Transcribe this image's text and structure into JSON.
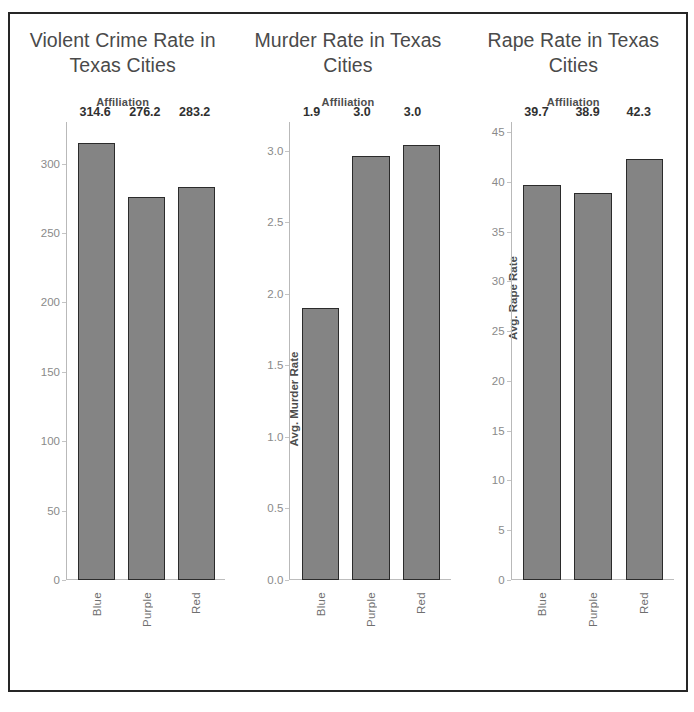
{
  "page": {
    "border_color": "#262626",
    "background": "#ffffff"
  },
  "style": {
    "bar_fill": "#848484",
    "bar_stroke": "#2b2b2b",
    "axis_color": "#b9b9b9",
    "tick_text_color": "#8a8a8a",
    "title_color": "#4a4a4a",
    "value_label_color": "#303030"
  },
  "charts": [
    {
      "title": "Violent Crime Rate in Texas Cities",
      "legend_title": "Affiliation",
      "ylabel": "Avg. Violent Crime Rate",
      "categories": [
        "Blue",
        "Purple",
        "Red"
      ],
      "values": [
        "314.6",
        "276.2",
        "283.2"
      ],
      "yticks": [
        "300",
        "250",
        "200",
        "150",
        "100",
        "50",
        "0"
      ]
    },
    {
      "title": "Murder Rate in Texas Cities",
      "legend_title": "Affiliation",
      "ylabel": "Avg. Murder Rate",
      "categories": [
        "Blue",
        "Purple",
        "Red"
      ],
      "values": [
        "1.9",
        "3.0",
        "3.0"
      ],
      "yticks": [
        "3.0",
        "2.5",
        "2.0",
        "1.5",
        "1.0",
        "0.5",
        "0.0"
      ]
    },
    {
      "title": "Rape Rate in Texas Cities",
      "legend_title": "Affiliation",
      "ylabel": "Avg. Rape Rate",
      "categories": [
        "Blue",
        "Purple",
        "Red"
      ],
      "values": [
        "39.7",
        "38.9",
        "42.3"
      ],
      "yticks": [
        "45",
        "40",
        "35",
        "30",
        "25",
        "20",
        "15",
        "10",
        "5",
        "0"
      ]
    }
  ],
  "chart_data": [
    {
      "type": "bar",
      "title": "Violent Crime Rate in Texas Cities",
      "xlabel": "Affiliation",
      "ylabel": "Avg. Violent Crime Rate",
      "categories": [
        "Blue",
        "Purple",
        "Red"
      ],
      "values": [
        314.6,
        276.2,
        283.2
      ],
      "ylim": [
        0,
        330
      ],
      "yticks": [
        0,
        50,
        100,
        150,
        200,
        250,
        300
      ],
      "grid": false,
      "legend": "none",
      "data_labels": [
        "314.6",
        "276.2",
        "283.2"
      ]
    },
    {
      "type": "bar",
      "title": "Murder Rate in Texas Cities",
      "xlabel": "Affiliation",
      "ylabel": "Avg. Murder Rate",
      "categories": [
        "Blue",
        "Purple",
        "Red"
      ],
      "values": [
        1.9,
        2.96,
        3.04
      ],
      "ylim": [
        0.0,
        3.2
      ],
      "yticks": [
        0.0,
        0.5,
        1.0,
        1.5,
        2.0,
        2.5,
        3.0
      ],
      "grid": false,
      "legend": "none",
      "data_labels": [
        "1.9",
        "3.0",
        "3.0"
      ]
    },
    {
      "type": "bar",
      "title": "Rape Rate in Texas Cities",
      "xlabel": "Affiliation",
      "ylabel": "Avg. Rape Rate",
      "categories": [
        "Blue",
        "Purple",
        "Red"
      ],
      "values": [
        39.7,
        38.9,
        42.3
      ],
      "ylim": [
        0,
        46
      ],
      "yticks": [
        0,
        5,
        10,
        15,
        20,
        25,
        30,
        35,
        40,
        45
      ],
      "grid": false,
      "legend": "none",
      "data_labels": [
        "39.7",
        "38.9",
        "42.3"
      ]
    }
  ]
}
